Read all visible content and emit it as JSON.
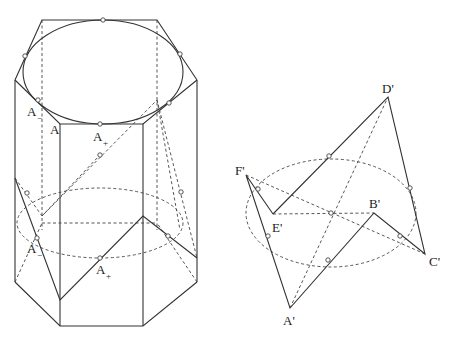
{
  "figure": {
    "left": {
      "description": "Hexagonal prism with inscribed ellipses and zigzag cross-section",
      "labels": {
        "a_minus_top": {
          "main": "A",
          "sub": "−"
        },
        "a_vertex": {
          "main": "A",
          "sub": ""
        },
        "a_plus_top": {
          "main": "A",
          "sub": "+"
        },
        "a_minus_bottom": {
          "main": "A",
          "sub": "−"
        },
        "a_plus_bottom": {
          "main": "A",
          "sub": "+"
        }
      }
    },
    "right": {
      "description": "Skew hexagon A'B'C'D'E'F' around a dashed ellipse",
      "labels": {
        "d_prime": "D'",
        "f_prime": "F'",
        "e_prime": "E'",
        "b_prime": "B'",
        "c_prime": "C'",
        "a_prime": "A'"
      }
    }
  },
  "colors": {
    "line": "#333333",
    "background": "#ffffff"
  }
}
